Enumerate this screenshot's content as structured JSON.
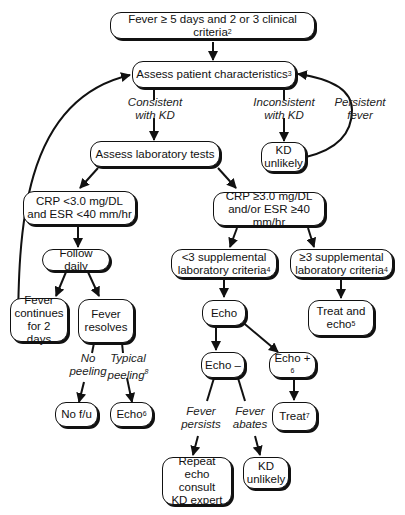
{
  "diagram": {
    "type": "flowchart",
    "nodes": {
      "start": {
        "text": "Fever ≥ 5 days and 2 or 3 clinical criteria",
        "sup": "2"
      },
      "assess_patient": {
        "text": "Assess patient characteristics",
        "sup": "3"
      },
      "kd_unlikely_top": {
        "line1": "KD",
        "line2": "unlikely"
      },
      "assess_lab": {
        "text": "Assess laboratory tests"
      },
      "crp_low": {
        "line1": "CRP <3.0 mg/DL",
        "line2": "and ESR <40 mm/hr"
      },
      "crp_high": {
        "line1": "CRP ≥3.0 mg/DL",
        "line2": "and/or ESR ≥40 mm/hr"
      },
      "follow_daily": {
        "text": "Follow daily"
      },
      "lt3_supp": {
        "line1": "<3 supplemental",
        "line2": "laboratory criteria",
        "sup": "4"
      },
      "ge3_supp": {
        "line1": "≥3 supplemental",
        "line2": "laboratory criteria",
        "sup": "4"
      },
      "fever_continues": {
        "line1": "Fever",
        "line2": "continues",
        "line3": "for 2 days"
      },
      "fever_resolves": {
        "line1": "Fever",
        "line2": "resolves"
      },
      "echo": {
        "text": "Echo"
      },
      "treat_echo": {
        "line1": "Treat and",
        "line2": "echo",
        "sup": "5"
      },
      "echo_neg": {
        "text": "Echo –"
      },
      "echo_pos": {
        "text": "Echo + ",
        "sup": "6"
      },
      "no_fu": {
        "text": "No f/u"
      },
      "echo6": {
        "text": "Echo",
        "sup": "6"
      },
      "treat7": {
        "text": "Treat",
        "sup": "7"
      },
      "repeat_echo": {
        "line1": "Repeat echo",
        "line2": "consult",
        "line3": "KD expert"
      },
      "kd_unlikely_bottom": {
        "line1": "KD",
        "line2": "unlikely"
      }
    },
    "edge_labels": {
      "consistent": {
        "line1": "Consistent",
        "line2": "with KD"
      },
      "inconsistent": {
        "line1": "Inconsistent",
        "line2": "with KD"
      },
      "persistent": {
        "line1": "Persistent",
        "line2": "fever"
      },
      "no_peeling": {
        "line1": "No",
        "line2": "peeling"
      },
      "typical_peeling": {
        "line1": "Typical",
        "line2": "peeling",
        "sup": "8"
      },
      "fever_persists": {
        "line1": "Fever",
        "line2": "persists"
      },
      "fever_abates": {
        "line1": "Fever",
        "line2": "abates"
      }
    }
  }
}
